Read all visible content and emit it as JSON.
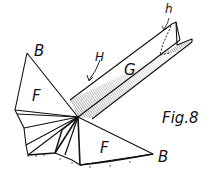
{
  "figure": {
    "caption": "Fig.8",
    "labels": {
      "b_top": "B",
      "f_left": "F",
      "h_lower": "h",
      "h_upper": "H",
      "g": "G",
      "f_bottom": "F",
      "b_bottom": "B"
    },
    "colors": {
      "ink": "#111111",
      "background": "#ffffff"
    }
  }
}
